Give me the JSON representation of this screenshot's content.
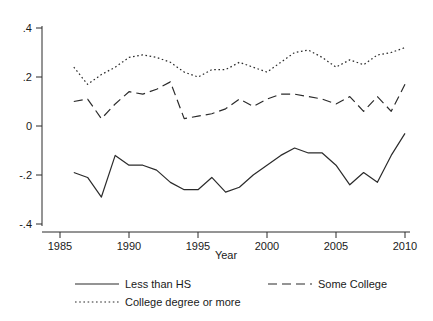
{
  "chart_data": {
    "type": "line",
    "title": "",
    "xlabel": "Year",
    "ylabel": "",
    "xlim": [
      1985,
      2010
    ],
    "ylim": [
      -0.4,
      0.4
    ],
    "grid": false,
    "legend_position": "bottom",
    "x_ticks": [
      "1985",
      "1990",
      "1995",
      "2000",
      "2005",
      "2010"
    ],
    "x_tick_values": [
      1985,
      1990,
      1995,
      2000,
      2005,
      2010
    ],
    "y_ticks": [
      "-.4",
      "-.2",
      "0",
      ".2",
      ".4"
    ],
    "y_tick_values": [
      -0.4,
      -0.2,
      0,
      0.2,
      0.4
    ],
    "x": [
      1986,
      1987,
      1988,
      1989,
      1990,
      1991,
      1992,
      1993,
      1994,
      1995,
      1996,
      1997,
      1998,
      1999,
      2000,
      2001,
      2002,
      2003,
      2004,
      2005,
      2006,
      2007,
      2008,
      2009,
      2010
    ],
    "series": [
      {
        "name": "Less than HS",
        "style": "solid",
        "values": [
          -0.19,
          -0.21,
          -0.29,
          -0.12,
          -0.16,
          -0.16,
          -0.18,
          -0.23,
          -0.26,
          -0.26,
          -0.21,
          -0.27,
          -0.25,
          -0.2,
          -0.16,
          -0.12,
          -0.09,
          -0.11,
          -0.11,
          -0.16,
          -0.24,
          -0.19,
          -0.23,
          -0.12,
          -0.03
        ]
      },
      {
        "name": "Some College",
        "style": "dashed",
        "values": [
          0.1,
          0.11,
          0.03,
          0.09,
          0.14,
          0.13,
          0.15,
          0.18,
          0.03,
          0.04,
          0.05,
          0.07,
          0.11,
          0.08,
          0.11,
          0.13,
          0.13,
          0.12,
          0.11,
          0.09,
          0.12,
          0.06,
          0.12,
          0.06,
          0.17
        ]
      },
      {
        "name": "College degree or more",
        "style": "dotted",
        "values": [
          0.24,
          0.17,
          0.21,
          0.24,
          0.28,
          0.29,
          0.28,
          0.26,
          0.22,
          0.2,
          0.23,
          0.23,
          0.26,
          0.24,
          0.22,
          0.26,
          0.3,
          0.31,
          0.28,
          0.24,
          0.27,
          0.25,
          0.29,
          0.3,
          0.32
        ]
      }
    ]
  },
  "legend": {
    "entries": [
      {
        "label": "Less than HS",
        "style": "solid"
      },
      {
        "label": "Some College",
        "style": "dashed"
      },
      {
        "label": "College degree or more",
        "style": "dotted"
      }
    ]
  }
}
